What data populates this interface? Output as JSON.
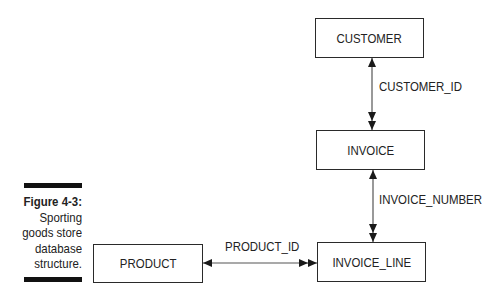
{
  "caption": {
    "figure_label": "Figure 4-3:",
    "lines": [
      "Sporting",
      "goods store",
      "database",
      "structure."
    ]
  },
  "entities": {
    "customer": "CUSTOMER",
    "invoice": "INVOICE",
    "invoice_line": "INVOICE_LINE",
    "product": "PRODUCT"
  },
  "relationships": {
    "customer_invoice": "CUSTOMER_ID",
    "invoice_invoice_line": "INVOICE_NUMBER",
    "product_invoice_line": "PRODUCT_ID"
  },
  "colors": {
    "line": "#2a2a2a",
    "bar": "#111111",
    "background": "#ffffff"
  }
}
